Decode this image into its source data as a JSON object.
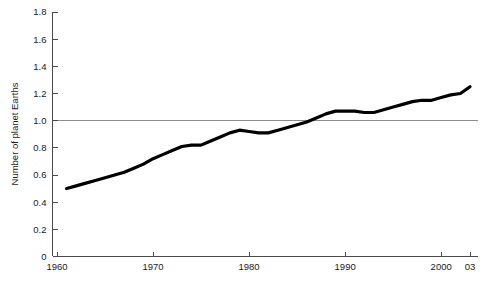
{
  "chart_data": {
    "type": "line",
    "title": "",
    "subtitle": "",
    "xlabel": "",
    "ylabel": "Number of planet Earths",
    "xlim": [
      1960,
      2003
    ],
    "ylim": [
      0,
      1.8
    ],
    "grid": false,
    "legend": null,
    "legend_position": "none",
    "y_ticks": [
      "0",
      "0.2",
      "0.4",
      "0.6",
      "0.8",
      "1.0",
      "1.2",
      "1.4",
      "1.6",
      "1.8"
    ],
    "y_tick_values": [
      0,
      0.2,
      0.4,
      0.6,
      0.8,
      1.0,
      1.2,
      1.4,
      1.6,
      1.8
    ],
    "x_ticks": [
      "1960",
      "1970",
      "1980",
      "1990",
      "2000",
      "03"
    ],
    "x_tick_values": [
      1960,
      1970,
      1980,
      1990,
      2000,
      2003
    ],
    "annotations": [
      {
        "name": "one-earth-reference-line",
        "value": 1.0,
        "label": "",
        "color": "#8c8c8c"
      }
    ],
    "series": [
      {
        "name": "Number of planet Earths",
        "color": "#000000",
        "x": [
          1961,
          1962,
          1963,
          1964,
          1965,
          1966,
          1967,
          1968,
          1969,
          1970,
          1971,
          1972,
          1973,
          1974,
          1975,
          1976,
          1977,
          1978,
          1979,
          1980,
          1981,
          1982,
          1983,
          1984,
          1985,
          1986,
          1987,
          1988,
          1989,
          1990,
          1991,
          1992,
          1993,
          1994,
          1995,
          1996,
          1997,
          1998,
          1999,
          2000,
          2001,
          2002,
          2003
        ],
        "values": [
          0.5,
          0.52,
          0.54,
          0.56,
          0.58,
          0.6,
          0.62,
          0.65,
          0.68,
          0.72,
          0.75,
          0.78,
          0.81,
          0.82,
          0.82,
          0.85,
          0.88,
          0.91,
          0.93,
          0.92,
          0.91,
          0.91,
          0.93,
          0.95,
          0.97,
          0.99,
          1.02,
          1.05,
          1.07,
          1.07,
          1.07,
          1.06,
          1.06,
          1.08,
          1.1,
          1.12,
          1.14,
          1.15,
          1.15,
          1.17,
          1.19,
          1.2,
          1.25
        ]
      }
    ]
  },
  "axis": {
    "y_title": "Number of planet Earths"
  }
}
